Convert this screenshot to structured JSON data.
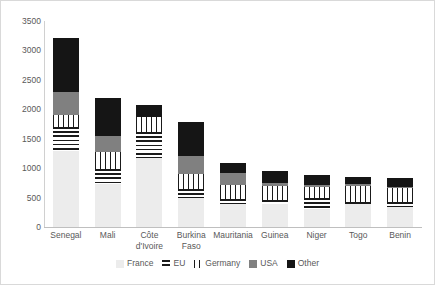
{
  "chart_data": {
    "type": "bar",
    "subtype": "stacked-bar",
    "title": "",
    "xlabel": "",
    "ylabel": "",
    "ylim": [
      0,
      3500
    ],
    "ytick_step": 500,
    "yticks": [
      3500,
      3000,
      2500,
      2000,
      1500,
      1000,
      500,
      0
    ],
    "ytick_labels": [
      "3500",
      "3000",
      "2500",
      "2000",
      "1500",
      "1000",
      "500",
      "0"
    ],
    "grid": false,
    "legend_position": "bottom",
    "categories": [
      "Senegal",
      "Côte d'Ivoire",
      "Mali",
      "Burkina Faso",
      "Mauritania",
      "Guinea",
      "Niger",
      "Togo",
      "Benin"
    ],
    "category_display": [
      [
        "Senegal"
      ],
      [
        "Mali"
      ],
      [
        "Côte",
        "d'Ivoire"
      ],
      [
        "Burkina",
        "Faso"
      ],
      [
        "Mauritania"
      ],
      [
        "Guinea"
      ],
      [
        "Niger"
      ],
      [
        "Togo"
      ],
      [
        "Benin"
      ]
    ],
    "series": [
      {
        "name": "France",
        "pattern": "solid-light-gray",
        "color": "#ececec",
        "values": [
          1300,
          730,
          1170,
          490,
          390,
          390,
          300,
          390,
          340
        ]
      },
      {
        "name": "EU",
        "pattern": "horizontal-stripes",
        "color": "#1a1a1a",
        "values": [
          400,
          250,
          450,
          150,
          90,
          70,
          190,
          40,
          90
        ]
      },
      {
        "name": "Germany",
        "pattern": "vertical-stripes",
        "color": "#1a1a1a",
        "values": [
          200,
          300,
          250,
          260,
          230,
          240,
          190,
          270,
          230
        ]
      },
      {
        "name": "USA",
        "pattern": "solid-medium-gray",
        "color": "#808080",
        "values": [
          400,
          270,
          0,
          300,
          210,
          50,
          40,
          30,
          20
        ]
      },
      {
        "name": "Other",
        "pattern": "solid-black",
        "color": "#151515",
        "values": [
          920,
          650,
          200,
          580,
          170,
          210,
          160,
          120,
          150
        ]
      }
    ],
    "totals": [
      3220,
      2200,
      2070,
      1780,
      1090,
      960,
      880,
      850,
      830
    ]
  },
  "legend": {
    "items": [
      {
        "label": "France",
        "swatch": "france-swatch"
      },
      {
        "label": "EU",
        "swatch": "eu-swatch"
      },
      {
        "label": "Germany",
        "swatch": "germany-swatch"
      },
      {
        "label": "USA",
        "swatch": "usa-swatch"
      },
      {
        "label": "Other",
        "swatch": "other-swatch"
      }
    ]
  }
}
